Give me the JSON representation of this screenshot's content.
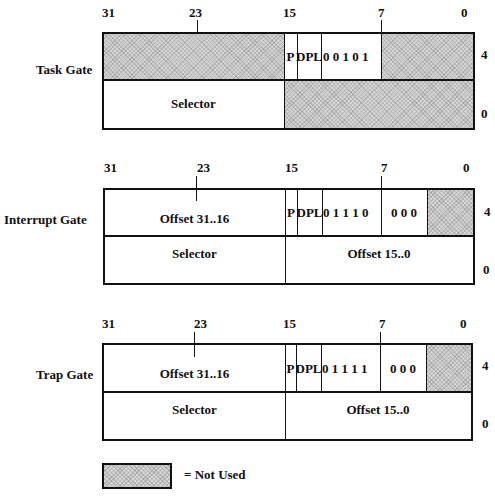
{
  "bit_labels": [
    "31",
    "23",
    "15",
    "7",
    "0"
  ],
  "offset_labels": [
    "4",
    "0"
  ],
  "gates": [
    {
      "name": "Task Gate",
      "high_word": {
        "upper_left": "",
        "p": "P",
        "dpl": "DPL",
        "type_bits": "0 0 1 0 1",
        "low_bits": ""
      },
      "low_word": {
        "left": "Selector",
        "right": ""
      }
    },
    {
      "name": "Interrupt Gate",
      "high_word": {
        "upper_left": "Offset  31..16",
        "p": "P",
        "dpl": "DPL",
        "type_bits": "0 1 1 1 0",
        "low_bits": "0 0 0"
      },
      "low_word": {
        "left": "Selector",
        "right": "Offset  15..0"
      }
    },
    {
      "name": "Trap Gate",
      "high_word": {
        "upper_left": "Offset  31..16",
        "p": "P",
        "dpl": "DPL",
        "type_bits": "0 1 1 1 1",
        "low_bits": "0 0 0"
      },
      "low_word": {
        "left": "Selector",
        "right": "Offset  15..0"
      }
    }
  ],
  "legend": {
    "label": "= Not Used"
  },
  "colors": {
    "hatch": "#d4d4d4",
    "line": "#111111"
  }
}
